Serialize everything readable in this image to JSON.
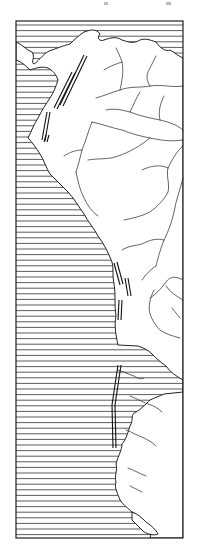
{
  "map": {
    "title": "",
    "region": "Western South America",
    "colors": {
      "ink": "#222222",
      "paper": "#ffffff",
      "ocean_hatch": "#333333"
    },
    "layers": [
      {
        "name": "ocean",
        "style": "horizontal-hatching"
      },
      {
        "name": "coastline",
        "style": "solid-line"
      },
      {
        "name": "rivers",
        "style": "thin-line"
      },
      {
        "name": "trench-fault-marks",
        "style": "double-line-segments"
      }
    ]
  }
}
